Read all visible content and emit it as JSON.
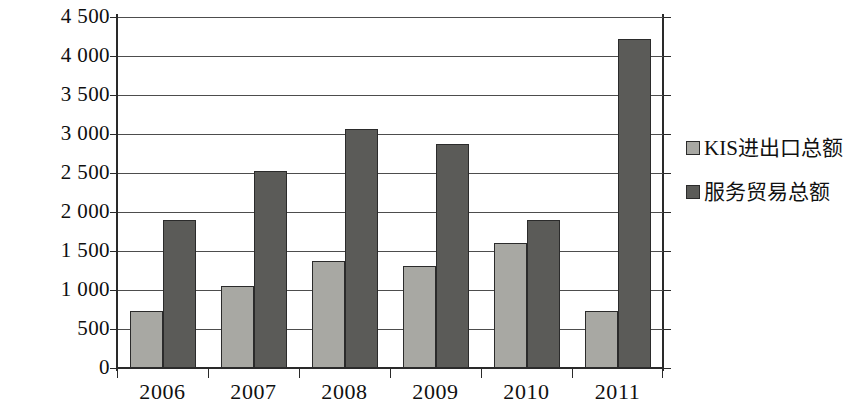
{
  "chart_data": {
    "type": "bar",
    "title": "",
    "subtitle": "",
    "xlabel": "",
    "ylabel": "",
    "categories": [
      "2006",
      "2007",
      "2008",
      "2009",
      "2010",
      "2011"
    ],
    "series": [
      {
        "name": "KIS进出口总额",
        "color": "#a8a8a3",
        "values": [
          730,
          1050,
          1370,
          1310,
          1600,
          730
        ]
      },
      {
        "name": "服务贸易总额",
        "color": "#5b5b58",
        "values": [
          1900,
          2520,
          3060,
          2870,
          1900,
          4220
        ]
      }
    ],
    "ylim": [
      0,
      4500
    ],
    "ytick_step": 500,
    "ytick_labels": [
      "4 500",
      "4 000",
      "3 500",
      "3 000",
      "2 500",
      "2 000",
      "1 500",
      "1 000",
      "500",
      "0"
    ],
    "ytick_values": [
      4500,
      4000,
      3500,
      3000,
      2500,
      2000,
      1500,
      1000,
      500,
      0
    ],
    "grid": true,
    "legend_position": "right",
    "annotations": []
  },
  "legend": {
    "items": [
      {
        "label": "KIS进出口总额",
        "swatch": "light"
      },
      {
        "label": "服务贸易总额",
        "swatch": "dark"
      }
    ]
  }
}
